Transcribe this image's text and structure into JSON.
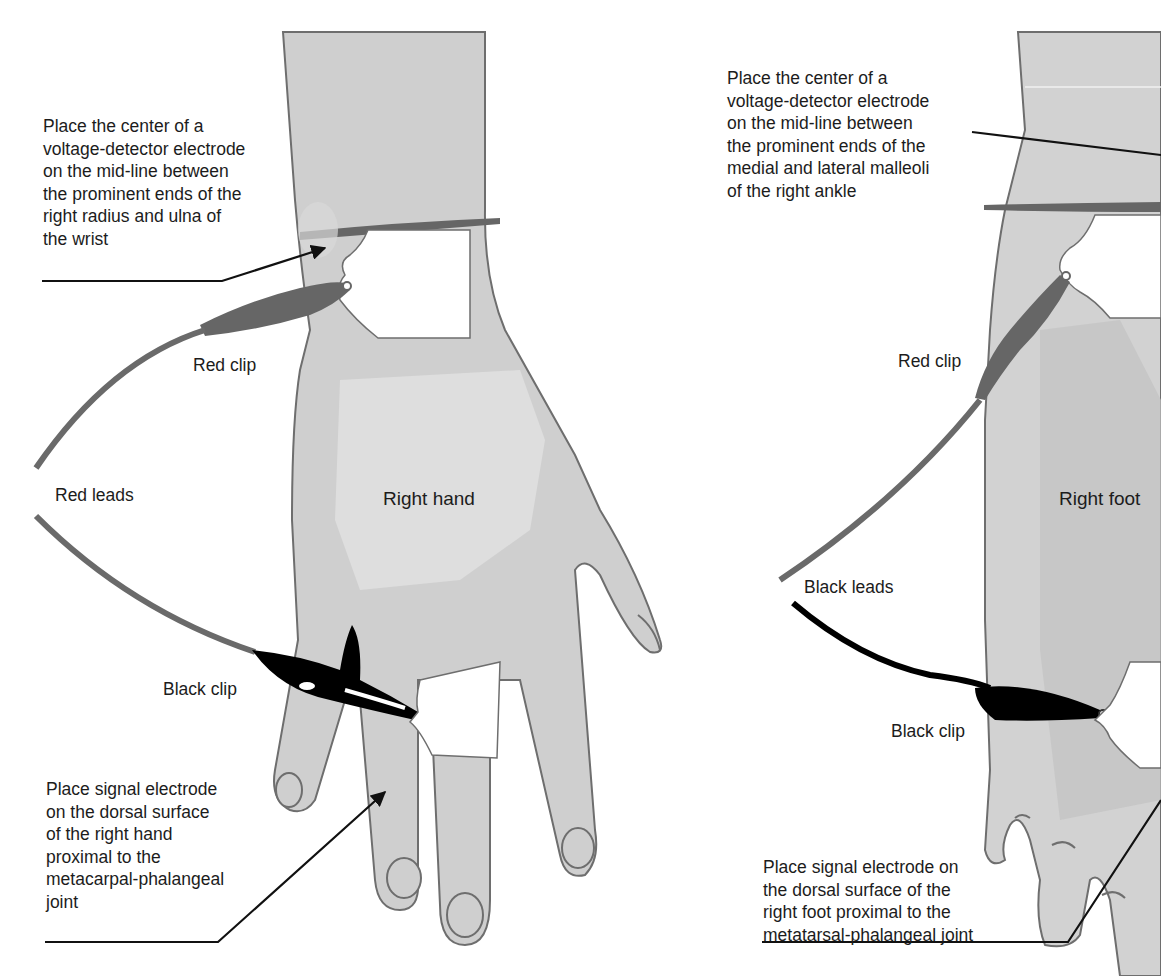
{
  "colors": {
    "skin": "#cfcfcf",
    "skin_light": "#dedede",
    "skin_dark": "#bdbdbd",
    "outline": "#6e6e6e",
    "red_lead": "#6a6a6a",
    "black_lead": "#000000",
    "electrode": "#ffffff",
    "text": "#1c1c1c"
  },
  "hand_panel": {
    "body_label": "Right hand",
    "wrist_callout": "Place the center of a\nvoltage-detector electrode\non the mid-line between\nthe prominent ends of the\nright radius and ulna of\nthe wrist",
    "red_clip_label": "Red clip",
    "leads_label": "Red leads",
    "black_clip_label": "Black clip",
    "signal_callout": "Place signal electrode\non the dorsal surface\nof the right hand\nproximal to the\nmetacarpal-phalangeal\njoint"
  },
  "foot_panel": {
    "body_label": "Right foot",
    "ankle_callout": "Place the center of a\nvoltage-detector electrode\non the mid-line between\nthe prominent ends of the\nmedial and lateral malleoli\nof the right ankle",
    "red_clip_label": "Red clip",
    "leads_label": "Black leads",
    "black_clip_label": "Black clip",
    "signal_callout": "Place signal electrode on\nthe dorsal surface of the\nright foot proximal to the\nmetatarsal-phalangeal joint"
  }
}
